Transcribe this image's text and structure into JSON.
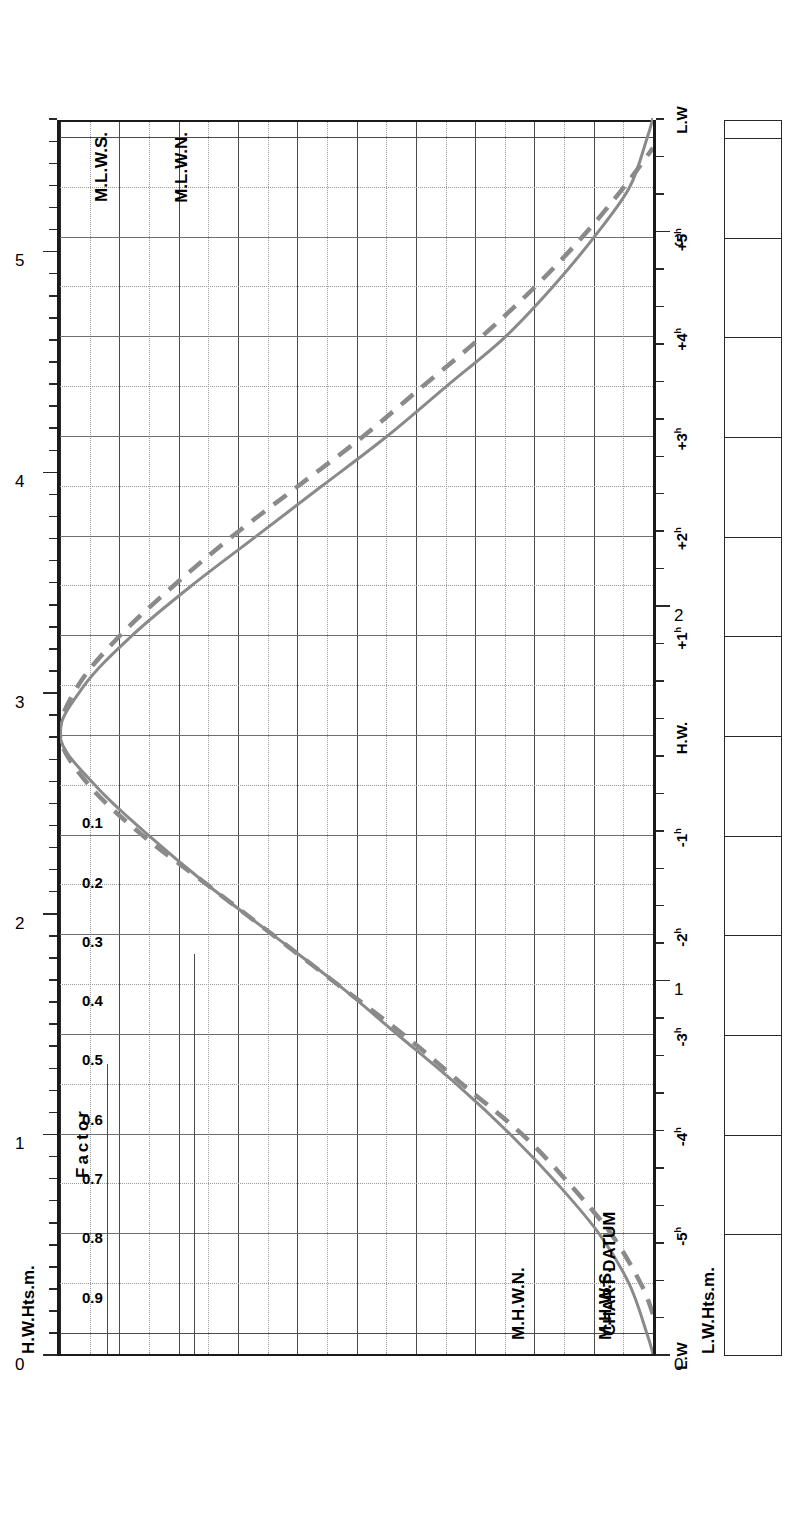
{
  "title": "MARGATE",
  "subtitle_line1": "MEAN SPRING",
  "subtitle_line2": "AND NEAP CURVES",
  "legend": {
    "header": "MEAN RANGES",
    "springs_label": "Springs",
    "springs_value": "4.3m",
    "neaps_label": "Neaps",
    "neaps_value": "2.5m",
    "springs_row": "Springs  4.3m",
    "neaps_row": "Neaps   2.5m"
  },
  "note": {
    "line1": "Springs occur 2 days",
    "line2": "after",
    "line3": "New and Full Moon"
  },
  "axes": {
    "left_title": "H.W.Hts.m.",
    "right_title": "L.W.Hts.m.",
    "factor_title": "Factor",
    "datum_label": "CHART DATUM",
    "hw_labels": [
      "0",
      "1",
      "2",
      "3",
      "4",
      "5"
    ],
    "lw_labels": [
      "0",
      "1",
      "2",
      "3"
    ],
    "factor_labels": [
      "0.9",
      "0.8",
      "0.7",
      "0.6",
      "0.5",
      "0.4",
      "0.3",
      "0.2",
      "0.1"
    ],
    "time_labels": [
      {
        "text": "L.W",
        "sup": ""
      },
      {
        "text": "-5",
        "sup": "h"
      },
      {
        "text": "-4",
        "sup": "h"
      },
      {
        "text": "-3",
        "sup": "h"
      },
      {
        "text": "-2",
        "sup": "h"
      },
      {
        "text": "-1",
        "sup": "h"
      },
      {
        "text": "H.W.",
        "sup": ""
      },
      {
        "text": "+1",
        "sup": "h"
      },
      {
        "text": "+2",
        "sup": "h"
      },
      {
        "text": "+3",
        "sup": "h"
      },
      {
        "text": "+4",
        "sup": "h"
      },
      {
        "text": "+5",
        "sup": "h"
      },
      {
        "text": "L.W",
        "sup": ""
      }
    ]
  },
  "markers": {
    "mhws": "M.H.W.S.",
    "mhwn": "M.H.W.N.",
    "mlwn": "M.L.W.N.",
    "mlws": "M.L.W.S."
  },
  "colors": {
    "curve": "#8a8a8a",
    "grid": "#4a4a4a",
    "grid_light": "#9a9a9a",
    "axis": "#1a1a1a",
    "text": "#000000"
  },
  "chart_data": {
    "type": "line",
    "xlabel": "Factor",
    "ylabel": "Time relative to High Water / Low Water",
    "xlim": [
      0,
      1
    ],
    "grid": true,
    "legend_position": "top",
    "orientation": "rotated-90",
    "hw_height_axis": {
      "label": "H.W.Hts.m.",
      "min": 0,
      "max": 5.6,
      "ticks": [
        0,
        1,
        2,
        3,
        4,
        5
      ],
      "minor_step": 0.1
    },
    "lw_height_axis": {
      "label": "L.W.Hts.m.",
      "min": 0,
      "max": 3.3,
      "ticks": [
        0,
        1,
        2,
        3
      ],
      "minor_step": 0.1
    },
    "reference_levels": [
      {
        "name": "M.H.W.S.",
        "value": 4.8,
        "axis": "hw"
      },
      {
        "name": "M.H.W.N.",
        "value": 3.9,
        "axis": "hw"
      },
      {
        "name": "M.L.W.N.",
        "value": 1.4,
        "axis": "lw"
      },
      {
        "name": "M.L.W.S.",
        "value": 0.5,
        "axis": "lw"
      }
    ],
    "mean_ranges": {
      "springs_m": 4.3,
      "neaps_m": 2.5
    },
    "time_ticks": [
      "L.W",
      "-5h",
      "-4h",
      "-3h",
      "-2h",
      "-1h",
      "H.W.",
      "+1h",
      "+2h",
      "+3h",
      "+4h",
      "+5h",
      "L.W"
    ],
    "factor_ticks": [
      0.1,
      0.2,
      0.3,
      0.4,
      0.5,
      0.6,
      0.7,
      0.8,
      0.9
    ],
    "series": [
      {
        "name": "Springs",
        "style": "solid",
        "color": "#8a8a8a",
        "hours": [
          -6.2,
          -6.0,
          -5.5,
          -5.0,
          -4.5,
          -4.0,
          -3.5,
          -3.0,
          -2.5,
          -2.0,
          -1.5,
          -1.0,
          -0.5,
          0.0,
          0.5,
          1.0,
          1.5,
          2.0,
          2.5,
          3.0,
          3.5,
          4.0,
          4.5,
          5.0,
          5.5,
          6.0,
          6.2
        ],
        "factor": [
          0.0,
          0.01,
          0.04,
          0.09,
          0.16,
          0.24,
          0.33,
          0.43,
          0.53,
          0.64,
          0.75,
          0.85,
          0.94,
          1.0,
          0.96,
          0.88,
          0.78,
          0.67,
          0.56,
          0.45,
          0.35,
          0.25,
          0.17,
          0.1,
          0.04,
          0.01,
          0.0
        ]
      },
      {
        "name": "Neaps",
        "style": "dashed",
        "color": "#8a8a8a",
        "hours": [
          -5.8,
          -5.5,
          -5.0,
          -4.5,
          -4.0,
          -3.5,
          -3.0,
          -2.5,
          -2.0,
          -1.5,
          -1.0,
          -0.5,
          0.0,
          0.5,
          1.0,
          1.5,
          2.0,
          2.5,
          3.0,
          3.5,
          4.0,
          4.5,
          5.0,
          5.5,
          5.9
        ],
        "factor": [
          0.0,
          0.02,
          0.07,
          0.14,
          0.22,
          0.32,
          0.42,
          0.53,
          0.64,
          0.75,
          0.86,
          0.95,
          1.0,
          0.97,
          0.9,
          0.81,
          0.71,
          0.6,
          0.49,
          0.39,
          0.29,
          0.2,
          0.12,
          0.05,
          0.0
        ]
      }
    ]
  }
}
